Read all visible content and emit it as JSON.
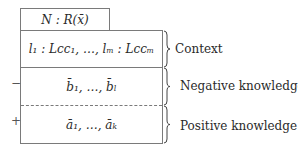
{
  "diagram": {
    "header": {
      "text": "N : R(x̄)"
    },
    "context": {
      "text": "l₁ : Lcc₁, …, lₘ : Lccₘ",
      "label": "Context"
    },
    "negative": {
      "text": "b̄₁, …, b̄ₗ",
      "label": "Negative knowledge",
      "sign": "−"
    },
    "positive": {
      "text": "ā₁, …, āₖ",
      "label": "Positive knowledge",
      "sign": "+"
    },
    "colors": {
      "border": "#7a7a7a",
      "text": "#2a2a2a",
      "background": "#ffffff"
    }
  }
}
